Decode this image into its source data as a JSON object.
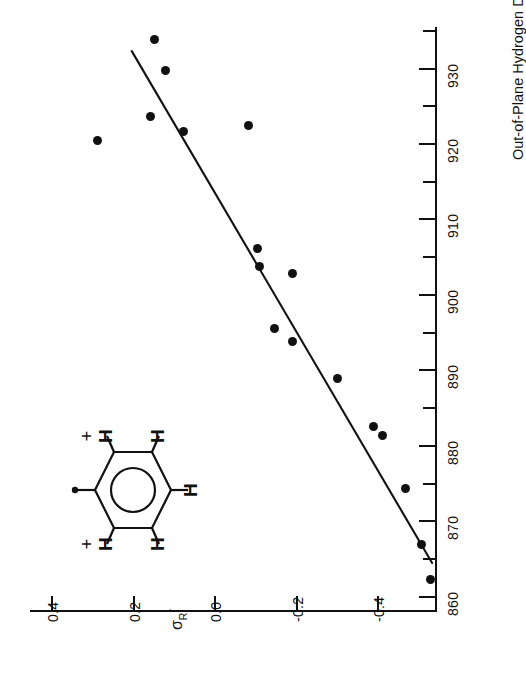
{
  "figure": {
    "background": "#ffffff",
    "ink": "#111111"
  },
  "chart_data": {
    "type": "scatter",
    "title": "",
    "orientation": "rotated-90",
    "xlabel": "σR°",
    "ylabel": "Out-of-Plane Hydrogen Deformation mode III, cm-1",
    "ylabel_parts": {
      "text": "Out-of-Plane Hydrogen Deformation mode III, cm",
      "superscript": "-1"
    },
    "xlabel_parts": {
      "symbol": "σ",
      "subscript": "R",
      "superscript": "°"
    },
    "grid": false,
    "legend": null,
    "xlim": [
      -0.545,
      0.455
    ],
    "ylim": [
      858.0,
      935.5
    ],
    "xticks": [
      0.4,
      0.2,
      0.0,
      -0.2,
      -0.4
    ],
    "xtick_labels": [
      "0.4",
      "0.2",
      "0.0",
      "-0.2",
      "-0.4"
    ],
    "yticks": [
      860,
      865,
      870,
      875,
      880,
      885,
      890,
      895,
      900,
      905,
      910,
      915,
      920,
      925,
      930,
      935
    ],
    "ytick_labels": [
      "860",
      "",
      "870",
      "",
      "880",
      "",
      "890",
      "",
      "900",
      "",
      "910",
      "",
      "920",
      "",
      "930",
      ""
    ],
    "ytick_labeled": [
      860,
      870,
      880,
      890,
      900,
      910,
      920,
      930
    ],
    "marker": "filled-circle",
    "marker_color": "#111111",
    "points": [
      {
        "sigma": 0.15,
        "wavenumber": 933.8
      },
      {
        "sigma": 0.122,
        "wavenumber": 929.7
      },
      {
        "sigma": 0.29,
        "wavenumber": 920.4
      },
      {
        "sigma": 0.16,
        "wavenumber": 923.7
      },
      {
        "sigma": 0.078,
        "wavenumber": 921.6
      },
      {
        "sigma": -0.082,
        "wavenumber": 922.5
      },
      {
        "sigma": -0.105,
        "wavenumber": 906.2
      },
      {
        "sigma": -0.11,
        "wavenumber": 903.8
      },
      {
        "sigma": -0.19,
        "wavenumber": 902.9
      },
      {
        "sigma": -0.145,
        "wavenumber": 895.6
      },
      {
        "sigma": -0.19,
        "wavenumber": 893.8
      },
      {
        "sigma": -0.3,
        "wavenumber": 889.0
      },
      {
        "sigma": -0.39,
        "wavenumber": 882.6
      },
      {
        "sigma": -0.41,
        "wavenumber": 881.4
      },
      {
        "sigma": -0.468,
        "wavenumber": 874.4
      },
      {
        "sigma": -0.508,
        "wavenumber": 866.9
      },
      {
        "sigma": -0.53,
        "wavenumber": 862.3
      }
    ],
    "fit_line": {
      "style": "solid",
      "color": "#111111",
      "endpoints": [
        {
          "sigma": 0.205,
          "wavenumber": 932.3
        },
        {
          "sigma": -0.533,
          "wavenumber": 864.5
        }
      ]
    }
  },
  "inset": {
    "name": "benzene-ring-structure",
    "ring": "benzene",
    "aromatic_circle": true,
    "substituent_marker": "•",
    "hydrogen_labels": [
      "H",
      "H",
      "H",
      "H",
      "H"
    ],
    "charge_labels": [
      "+",
      "+"
    ],
    "description": "Benzene ring with attachment point at left, five H substituents, plus signs at the two ortho H positions"
  }
}
